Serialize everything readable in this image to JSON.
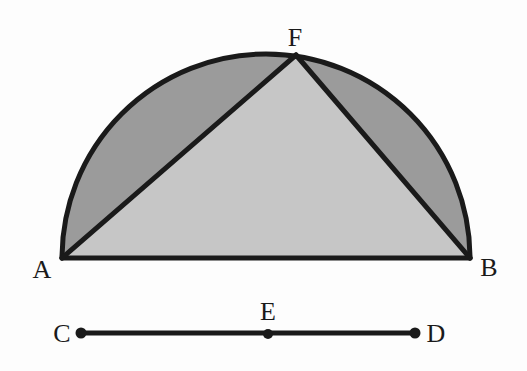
{
  "figure": {
    "canvas": {
      "width": 527,
      "height": 371,
      "background": "#fdfdfd"
    },
    "colors": {
      "stroke": "#1a1a1a",
      "inner_triangle_fill": "#c6c6c6",
      "outer_segment_fill": "#9b9b9b",
      "background": "#fdfdfd",
      "label_color": "#1a1a1a"
    },
    "stroke_widths": {
      "arc": 5,
      "diameter": 5,
      "chord": 5,
      "segment_line": 5
    },
    "semicircle": {
      "center_x": 266,
      "center_y": 258,
      "radius": 204,
      "diameter_endpoints": [
        "A",
        "B"
      ],
      "apex_point": "F"
    },
    "points": [
      {
        "id": "A",
        "label": "A",
        "x": 62,
        "y": 258,
        "label_x": 42,
        "label_y": 270,
        "dot": false
      },
      {
        "id": "B",
        "label": "B",
        "x": 470,
        "y": 258,
        "label_x": 489,
        "label_y": 268,
        "dot": false
      },
      {
        "id": "F",
        "label": "F",
        "x": 296,
        "y": 55,
        "label_x": 295,
        "label_y": 38,
        "dot": false
      },
      {
        "id": "C",
        "label": "C",
        "x": 81,
        "y": 333,
        "label_x": 62,
        "label_y": 334,
        "dot": true
      },
      {
        "id": "E",
        "label": "E",
        "x": 268,
        "y": 334,
        "label_x": 268,
        "label_y": 312,
        "dot": true
      },
      {
        "id": "D",
        "label": "D",
        "x": 415,
        "y": 333,
        "label_x": 436,
        "label_y": 334,
        "dot": true
      }
    ],
    "regions": [
      {
        "id": "left-segment",
        "name": "segment-A-F",
        "fill": "#9b9b9b",
        "description": "region between chord AF and arc AF"
      },
      {
        "id": "right-segment",
        "name": "segment-F-B",
        "fill": "#9b9b9b",
        "description": "region between chord FB and arc FB"
      },
      {
        "id": "inner-triangle",
        "name": "triangle-A-F-B",
        "fill": "#c6c6c6",
        "description": "triangle with vertices A, F, B"
      }
    ],
    "segments": [
      {
        "id": "AB",
        "from": "A",
        "to": "B",
        "kind": "diameter"
      },
      {
        "id": "AF",
        "from": "A",
        "to": "F",
        "kind": "chord"
      },
      {
        "id": "FB",
        "from": "F",
        "to": "B",
        "kind": "chord"
      },
      {
        "id": "CD",
        "from": "C",
        "to": "D",
        "kind": "line-segment",
        "marked_point": "E"
      }
    ],
    "paths": {
      "arc_full": "M 62 258 A 204 204 0 0 1 470 258",
      "left_region": "M 62 258 A 204 204 0 0 1 296 55 L 62 258 Z",
      "right_region": "M 296 55 A 204 204 0 0 1 470 258 L 296 55 Z",
      "triangle": "M 62 258 L 296 55 L 470 258 Z"
    },
    "dot_radius": 5.5
  }
}
